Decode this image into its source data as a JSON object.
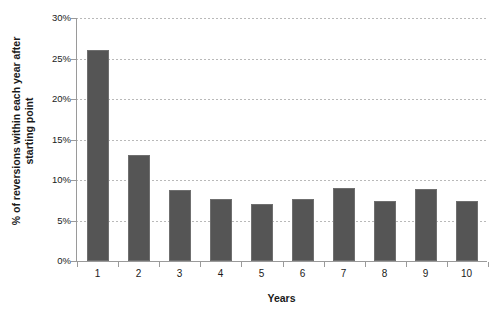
{
  "chart_data": {
    "type": "bar",
    "title": "",
    "xlabel": "Years",
    "ylabel": "% of reversions within each year after starting point",
    "ylabel_lines": [
      "% of reversions within each year after",
      "starting point"
    ],
    "categories": [
      "1",
      "2",
      "3",
      "4",
      "5",
      "6",
      "7",
      "8",
      "9",
      "10"
    ],
    "values": [
      26.1,
      13.1,
      8.8,
      7.6,
      7.0,
      7.7,
      9.0,
      7.4,
      8.9,
      7.4
    ],
    "ylim": [
      0,
      30
    ],
    "ytick_values": [
      0,
      5,
      10,
      15,
      20,
      25,
      30
    ],
    "ytick_labels": [
      "0%",
      "5%",
      "10%",
      "15%",
      "20%",
      "25%",
      "30%"
    ],
    "grid": true,
    "grid_axis": "y",
    "legend": false,
    "legend_position": "none",
    "bar_color": "#555555",
    "gridline_color": "#b9b9b9",
    "axis_color": "#9a9a9a",
    "text_color": "#1a1a1a",
    "background_color": "#ffffff"
  }
}
